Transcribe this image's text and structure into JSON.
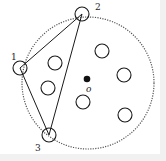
{
  "diagram": {
    "type": "geometry",
    "colors": {
      "stroke": "#1a1a1a",
      "dotted_circle": "#555555",
      "background": "#ffffff",
      "border": "#f1f1f1"
    },
    "boundary_circle": {
      "cx": 88,
      "cy": 83,
      "r": 66,
      "style": "dotted"
    },
    "center": {
      "x": 87,
      "y": 79,
      "label": "o"
    },
    "boundary_points": [
      {
        "id": "1",
        "label": "1",
        "cx": 20,
        "cy": 68,
        "r": 7
      },
      {
        "id": "2",
        "label": "2",
        "cx": 82,
        "cy": 14,
        "r": 7
      },
      {
        "id": "3",
        "label": "3",
        "cx": 49,
        "cy": 135,
        "r": 7
      }
    ],
    "interior_points": [
      {
        "cx": 55,
        "cy": 63,
        "r": 7
      },
      {
        "cx": 102,
        "cy": 51,
        "r": 7
      },
      {
        "cx": 124,
        "cy": 75,
        "r": 7
      },
      {
        "cx": 48,
        "cy": 88,
        "r": 7
      },
      {
        "cx": 83,
        "cy": 102,
        "r": 7
      },
      {
        "cx": 125,
        "cy": 115,
        "r": 7
      }
    ],
    "triangle_edges": [
      {
        "from": "1",
        "to": "2"
      },
      {
        "from": "2",
        "to": "3"
      },
      {
        "from": "3",
        "to": "1"
      }
    ],
    "labels": {
      "point_1": "1",
      "point_2": "2",
      "point_3": "3",
      "center": "o"
    }
  }
}
